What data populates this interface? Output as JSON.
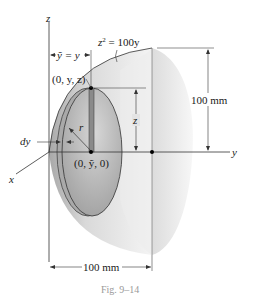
{
  "figure": {
    "caption": "Fig. 9–14",
    "equation": "z² = 100y",
    "equation_parts": {
      "base": "z",
      "exp": "2",
      "rest": " = 100y"
    },
    "axes": {
      "x": "x",
      "y": "y",
      "z": "z"
    },
    "labels": {
      "ybar_eq": "ỹ = y",
      "point_top": "(0, y, z)",
      "point_center": "(0, ỹ, 0)",
      "radius": "r",
      "z_dim": "z",
      "dy": "dy"
    },
    "dimensions": {
      "height": "100 mm",
      "length": "100 mm"
    },
    "colors": {
      "line": "#333333",
      "dim_line": "#444444",
      "surface_light": "#f2f2f2",
      "surface_mid": "#d8d8d8",
      "surface_dark": "#9a9a9a",
      "disk": "#b8b8b8",
      "strip": "#7a7a7a",
      "caption": "#9a9a9a"
    }
  }
}
